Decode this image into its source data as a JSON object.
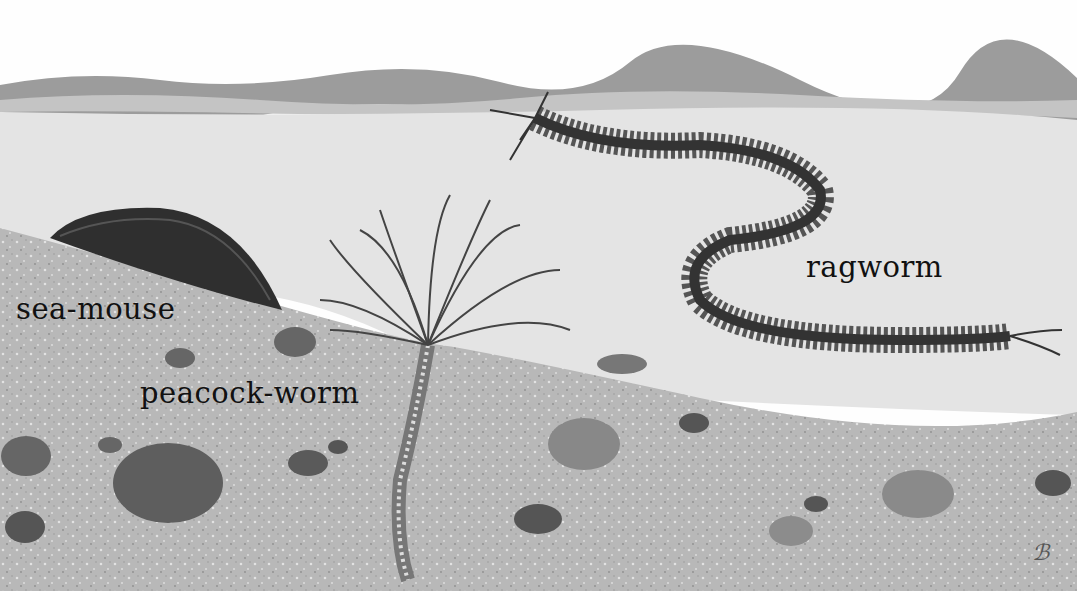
{
  "illustration": {
    "description": "Seabed scene with sea creatures",
    "labels": {
      "sea_mouse": "sea-mouse",
      "peacock_worm": "peacock-worm",
      "ragworm": "ragworm"
    },
    "signature": "ℬ"
  }
}
